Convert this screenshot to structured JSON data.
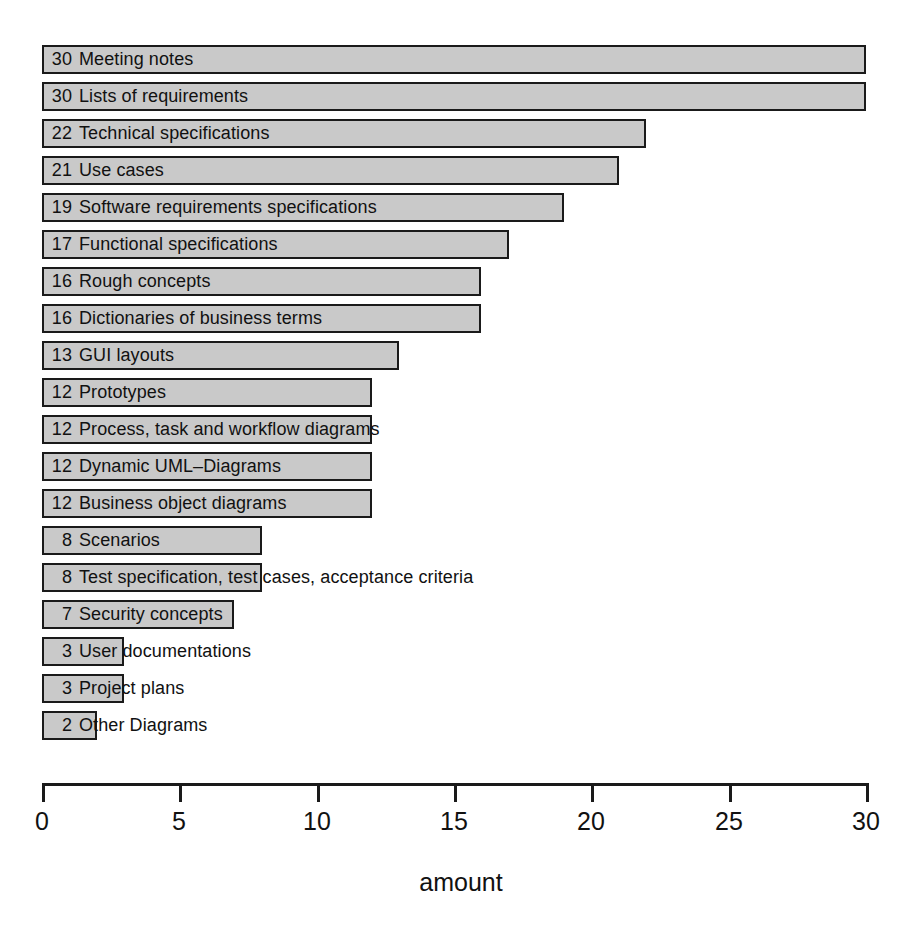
{
  "chart_data": {
    "type": "bar",
    "orientation": "horizontal",
    "title": "",
    "xlabel": "amount",
    "ylabel": "",
    "xlim": [
      0,
      30
    ],
    "xticks": [
      0,
      5,
      10,
      15,
      20,
      25,
      30
    ],
    "grid": false,
    "legend": null,
    "categories": [
      "Meeting notes",
      "Lists of requirements",
      "Technical specifications",
      "Use cases",
      "Software requirements specifications",
      "Functional specifications",
      "Rough concepts",
      "Dictionaries of business terms",
      "GUI layouts",
      "Prototypes",
      "Process, task and workflow diagrams",
      "Dynamic UML–Diagrams",
      "Business object diagrams",
      "Scenarios",
      "Test specification, test cases, acceptance criteria",
      "Security concepts",
      "User documentations",
      "Project plans",
      "Other Diagrams"
    ],
    "values": [
      30,
      30,
      22,
      21,
      19,
      17,
      16,
      16,
      13,
      12,
      12,
      12,
      12,
      8,
      8,
      7,
      3,
      3,
      2
    ],
    "bars": [
      {
        "value": 30,
        "label": "Meeting notes"
      },
      {
        "value": 30,
        "label": "Lists of requirements"
      },
      {
        "value": 22,
        "label": "Technical specifications"
      },
      {
        "value": 21,
        "label": "Use cases"
      },
      {
        "value": 19,
        "label": "Software requirements specifications"
      },
      {
        "value": 17,
        "label": "Functional specifications"
      },
      {
        "value": 16,
        "label": "Rough concepts"
      },
      {
        "value": 16,
        "label": "Dictionaries of business terms"
      },
      {
        "value": 13,
        "label": "GUI layouts"
      },
      {
        "value": 12,
        "label": "Prototypes"
      },
      {
        "value": 12,
        "label": "Process, task and workflow diagrams"
      },
      {
        "value": 12,
        "label": "Dynamic UML–Diagrams"
      },
      {
        "value": 12,
        "label": "Business object diagrams"
      },
      {
        "value": 8,
        "label": "Scenarios"
      },
      {
        "value": 8,
        "label": "Test specification, test cases, acceptance criteria"
      },
      {
        "value": 7,
        "label": "Security concepts"
      },
      {
        "value": 3,
        "label": "User documentations"
      },
      {
        "value": 3,
        "label": "Project plans"
      },
      {
        "value": 2,
        "label": "Other Diagrams"
      }
    ],
    "colors": {
      "bar_fill": "#c9c9c9",
      "bar_border": "#1a1a1a",
      "axis": "#1a1a1a",
      "text": "#111111",
      "background": "#ffffff"
    }
  }
}
